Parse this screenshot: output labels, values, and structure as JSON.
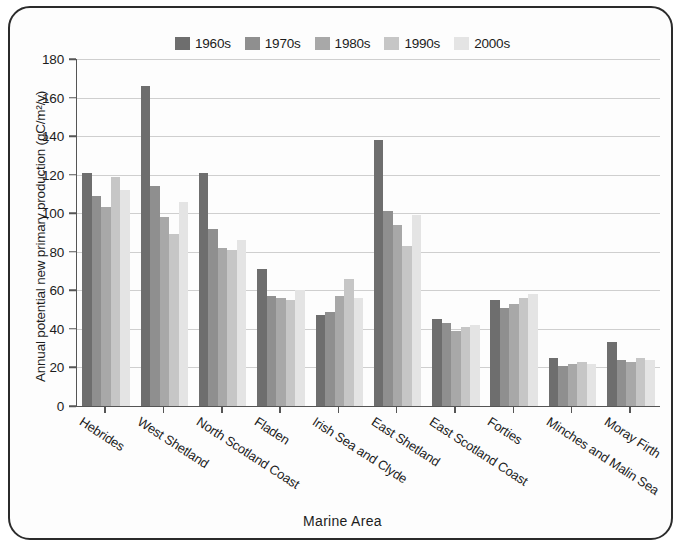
{
  "chart_data": {
    "type": "bar",
    "title": "",
    "xlabel": "Marine Area",
    "ylabel": "Annual potential new primary production (gC/m²/y)",
    "ylim": [
      0,
      180
    ],
    "ytick_step": 20,
    "yticks": [
      0,
      20,
      40,
      60,
      80,
      100,
      120,
      140,
      160,
      180
    ],
    "grid": true,
    "legend_position": "top-center",
    "categories": [
      "Hebrides",
      "West Shetland",
      "North Scotland Coast",
      "Fladen",
      "Irish Sea and Clyde",
      "East Shetland",
      "East Scotland Coast",
      "Forties",
      "Minches and Malin Sea",
      "Moray Firth"
    ],
    "series": [
      {
        "name": "1960s",
        "color": "#6e6e6e",
        "values": [
          121,
          166,
          121,
          71,
          47,
          138,
          45,
          55,
          25,
          33
        ]
      },
      {
        "name": "1970s",
        "color": "#8f8f8f",
        "values": [
          109,
          114,
          92,
          57,
          49,
          101,
          43,
          51,
          21,
          24
        ]
      },
      {
        "name": "1980s",
        "color": "#a8a8a8",
        "values": [
          103,
          98,
          82,
          56,
          57,
          94,
          39,
          53,
          22,
          23
        ]
      },
      {
        "name": "1990s",
        "color": "#c6c6c6",
        "values": [
          119,
          89,
          81,
          55,
          66,
          83,
          41,
          56,
          23,
          25
        ]
      },
      {
        "name": "2000s",
        "color": "#e4e4e4",
        "values": [
          112,
          106,
          86,
          60,
          56,
          99,
          42,
          58,
          22,
          24
        ]
      }
    ]
  },
  "legend": {
    "items": [
      {
        "label": "1960s",
        "color": "#6e6e6e"
      },
      {
        "label": "1970s",
        "color": "#8f8f8f"
      },
      {
        "label": "1980s",
        "color": "#a8a8a8"
      },
      {
        "label": "1990s",
        "color": "#c6c6c6"
      },
      {
        "label": "2000s",
        "color": "#e4e4e4"
      }
    ]
  },
  "axes": {
    "y_title": "Annual potential new primary production (gC/m²/y)",
    "x_title": "Marine Area",
    "y_tick_labels": [
      "0",
      "20",
      "40",
      "60",
      "80",
      "100",
      "120",
      "140",
      "160",
      "180"
    ]
  }
}
